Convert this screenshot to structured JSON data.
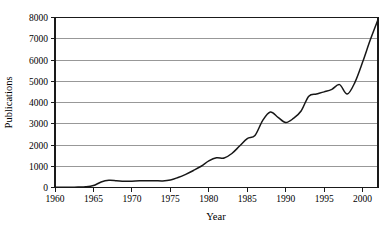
{
  "chart_data": {
    "type": "line",
    "title": "",
    "xlabel": "Year",
    "ylabel": "Publications",
    "xlim": [
      1960,
      2002
    ],
    "ylim": [
      0,
      8000
    ],
    "grid": "horizontal",
    "legend": "none",
    "x_ticks": [
      1960,
      1965,
      1970,
      1975,
      1980,
      1985,
      1990,
      1995,
      2000
    ],
    "y_ticks": [
      0,
      1000,
      2000,
      3000,
      4000,
      5000,
      6000,
      7000,
      8000
    ],
    "x_tick_labels": [
      "1960",
      "1965",
      "1970",
      "1975",
      "1980",
      "1985",
      "1990",
      "1995",
      "2000"
    ],
    "y_tick_labels": [
      "0",
      "1000",
      "2000",
      "3000",
      "4000",
      "5000",
      "6000",
      "7000",
      "8000"
    ],
    "series": [
      {
        "name": "Publications",
        "color": "#171717",
        "x": [
          1960,
          1961,
          1962,
          1963,
          1964,
          1965,
          1966,
          1967,
          1968,
          1969,
          1970,
          1971,
          1972,
          1973,
          1974,
          1975,
          1976,
          1977,
          1978,
          1979,
          1980,
          1981,
          1982,
          1983,
          1984,
          1985,
          1986,
          1987,
          1988,
          1989,
          1990,
          1991,
          1992,
          1993,
          1994,
          1995,
          1996,
          1997,
          1998,
          1999,
          2000,
          2001,
          2002
        ],
        "values": [
          10,
          12,
          15,
          20,
          30,
          90,
          260,
          340,
          320,
          290,
          300,
          315,
          320,
          320,
          310,
          350,
          470,
          620,
          800,
          1000,
          1250,
          1400,
          1390,
          1600,
          1950,
          2300,
          2450,
          3150,
          3550,
          3300,
          3060,
          3250,
          3600,
          4300,
          4400,
          4500,
          4620,
          4840,
          4400,
          4950,
          5900,
          6950,
          7900
        ]
      }
    ]
  },
  "axis": {
    "x_title": "Year",
    "y_title": "Publications"
  }
}
